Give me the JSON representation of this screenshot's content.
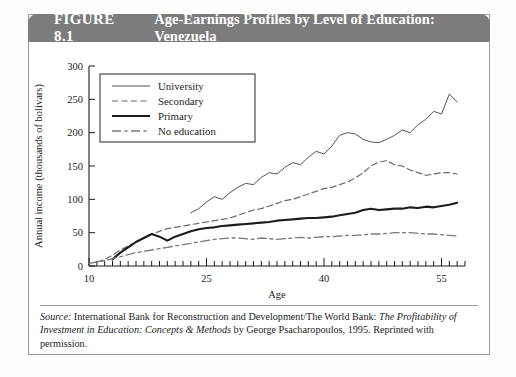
{
  "figure": {
    "number": "FIGURE 8.1",
    "title": "Age-Earnings Profiles by Level of Education: Venezuela",
    "header_bg": "#7c7c7c",
    "header_fg": "#ffffff"
  },
  "source": {
    "label": "Source:",
    "line1_rest": " International Bank for Reconstruction and Development/The World Bank: ",
    "italic1": "The",
    "italic2": "Profitability of Investment in Education: Concepts & Methods",
    "line2_rest": " by George Psacharopoulos,",
    "line3": "1995. Reprinted with permission."
  },
  "chart_data": {
    "type": "line",
    "title": "Age-Earnings Profiles by Level of Education: Venezuela",
    "xlabel": "Age",
    "ylabel": "Annual income (thousands of bolivars)",
    "xlim": [
      10,
      58
    ],
    "ylim": [
      0,
      300
    ],
    "xticks": [
      10,
      25,
      40,
      55
    ],
    "xtick_labels": [
      "10",
      "25",
      "40",
      "55"
    ],
    "xminor_step": 1,
    "yticks": [
      0,
      50,
      100,
      150,
      200,
      250,
      300
    ],
    "ytick_labels": [
      "0",
      "50",
      "100",
      "150",
      "200",
      "250",
      "300"
    ],
    "grid": false,
    "legend_position": "upper-left-inside",
    "series": [
      {
        "name": "University",
        "style": "thin-solid",
        "color": "#555555",
        "width": 1,
        "x": [
          23,
          24,
          25,
          26,
          27,
          28,
          29,
          30,
          31,
          32,
          33,
          34,
          35,
          36,
          37,
          38,
          39,
          40,
          41,
          42,
          43,
          44,
          45,
          46,
          47,
          48,
          49,
          50,
          51,
          52,
          53,
          54,
          55,
          56,
          57
        ],
        "values": [
          80,
          86,
          96,
          104,
          100,
          110,
          118,
          124,
          122,
          133,
          140,
          138,
          148,
          155,
          152,
          163,
          172,
          168,
          180,
          196,
          200,
          198,
          190,
          186,
          185,
          190,
          196,
          204,
          200,
          212,
          220,
          232,
          228,
          258,
          246
        ]
      },
      {
        "name": "Secondary",
        "style": "dashed",
        "color": "#6a6a6a",
        "width": 1.2,
        "x": [
          11,
          12,
          13,
          14,
          15,
          16,
          17,
          18,
          19,
          20,
          21,
          22,
          23,
          24,
          25,
          26,
          27,
          28,
          29,
          30,
          31,
          32,
          33,
          34,
          35,
          36,
          37,
          38,
          39,
          40,
          41,
          42,
          43,
          44,
          45,
          46,
          47,
          48,
          49,
          50,
          51,
          52,
          53,
          54,
          55,
          56,
          57
        ],
        "values": [
          6,
          10,
          16,
          24,
          30,
          36,
          42,
          48,
          52,
          56,
          58,
          60,
          62,
          64,
          66,
          68,
          70,
          72,
          76,
          80,
          84,
          86,
          90,
          94,
          98,
          100,
          104,
          108,
          112,
          116,
          118,
          122,
          126,
          132,
          140,
          150,
          156,
          158,
          152,
          150,
          144,
          140,
          136,
          138,
          140,
          140,
          138
        ]
      },
      {
        "name": "Primary",
        "style": "thick-solid",
        "color": "#1c1c1c",
        "width": 2.1,
        "x": [
          13,
          14,
          15,
          16,
          17,
          18,
          19,
          20,
          21,
          22,
          23,
          24,
          25,
          26,
          27,
          28,
          29,
          30,
          31,
          32,
          33,
          34,
          35,
          36,
          37,
          38,
          39,
          40,
          41,
          42,
          43,
          44,
          45,
          46,
          47,
          48,
          49,
          50,
          51,
          52,
          53,
          54,
          55,
          56,
          57
        ],
        "values": [
          10,
          20,
          28,
          36,
          42,
          48,
          44,
          38,
          44,
          48,
          52,
          55,
          57,
          58,
          60,
          61,
          62,
          63,
          64,
          65,
          66,
          68,
          69,
          70,
          71,
          72,
          72,
          73,
          74,
          76,
          78,
          80,
          84,
          86,
          84,
          85,
          86,
          86,
          88,
          87,
          89,
          88,
          90,
          92,
          95
        ]
      },
      {
        "name": "No education",
        "style": "dash-dot",
        "color": "#7a7a7a",
        "width": 1.3,
        "x": [
          10,
          11,
          12,
          13,
          14,
          15,
          16,
          17,
          18,
          19,
          20,
          21,
          22,
          23,
          24,
          25,
          26,
          27,
          28,
          29,
          30,
          31,
          32,
          33,
          34,
          35,
          36,
          37,
          38,
          39,
          40,
          41,
          42,
          43,
          44,
          45,
          46,
          47,
          48,
          49,
          50,
          51,
          52,
          53,
          54,
          55,
          56,
          57
        ],
        "values": [
          4,
          6,
          8,
          11,
          14,
          17,
          20,
          22,
          24,
          26,
          28,
          30,
          32,
          34,
          36,
          38,
          40,
          41,
          42,
          42,
          41,
          40,
          42,
          41,
          40,
          41,
          42,
          43,
          42,
          43,
          44,
          44,
          45,
          46,
          46,
          47,
          48,
          48,
          49,
          50,
          50,
          50,
          49,
          48,
          48,
          47,
          46,
          45
        ]
      }
    ]
  },
  "legend": {
    "items": [
      {
        "label": "University",
        "style": "thin-solid"
      },
      {
        "label": "Secondary",
        "style": "dashed"
      },
      {
        "label": "Primary",
        "style": "thick-solid"
      },
      {
        "label": "No education",
        "style": "dash-dot"
      }
    ]
  }
}
